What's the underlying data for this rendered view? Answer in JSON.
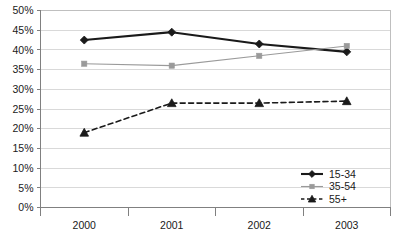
{
  "chart_data": {
    "type": "line",
    "title": "",
    "subtitle": "",
    "xlabel": "",
    "ylabel": "",
    "categories": [
      "2000",
      "2001",
      "2002",
      "2003"
    ],
    "ylim": [
      0,
      50
    ],
    "ytick_step": 5,
    "ytick_labels": [
      "0%",
      "5%",
      "10%",
      "15%",
      "20%",
      "25%",
      "30%",
      "35%",
      "40%",
      "45%",
      "50%"
    ],
    "ytick_values": [
      0,
      5,
      10,
      15,
      20,
      25,
      30,
      35,
      40,
      45,
      50
    ],
    "grid": "horizontal",
    "legend_position": "bottom-right",
    "value_unit": "%",
    "series": [
      {
        "name": "15-34",
        "values": [
          42.5,
          44.5,
          41.5,
          39.5
        ],
        "color": "#1a1a1a",
        "marker": "diamond",
        "line_style": "solid",
        "line_width": 2.1
      },
      {
        "name": "35-54",
        "values": [
          36.5,
          36.0,
          38.5,
          41.0
        ],
        "color": "#9a9a9a",
        "marker": "square",
        "line_style": "solid",
        "line_width": 1.1
      },
      {
        "name": "55+",
        "values": [
          19.0,
          26.5,
          26.5,
          27.0
        ],
        "color": "#1a1a1a",
        "marker": "triangle",
        "line_style": "dashed",
        "line_width": 1.6
      }
    ]
  },
  "axis": {
    "axis_color": "#808080",
    "grid_color": "#d9d9d9",
    "plot_border_color": "#bfbfbf"
  }
}
